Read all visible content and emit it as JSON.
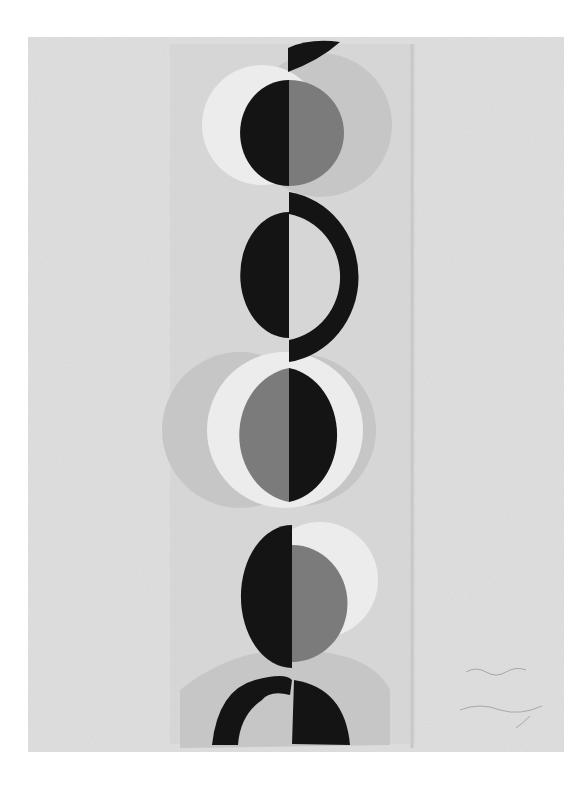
{
  "artwork": {
    "description": "Abstract grayscale painting: vertical column of stacked circles split into black and grey halves, with pale grey crescents behind, signed lower right",
    "signature_text": "",
    "colors": {
      "page": "#ffffff",
      "paper": "#dedede",
      "panel": "#d2d2d2",
      "light_grey": "#c4c4c4",
      "pale": "#e9e9e9",
      "mid_grey": "#7b7b7b",
      "black": "#141414"
    }
  }
}
